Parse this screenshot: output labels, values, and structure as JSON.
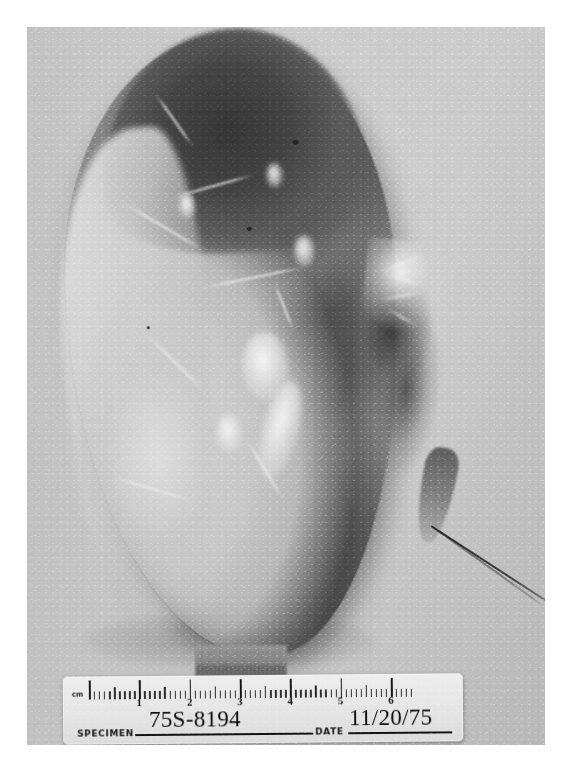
{
  "image": {
    "kind": "gross-pathology-photograph",
    "description": "Black-and-white photograph of a bisected kidney specimen photographed beside a centimeter ruler / specimen identification card.",
    "tone": "monochrome"
  },
  "photo": {
    "background_color": "#c9c9c7",
    "border_color": "#ffffff",
    "subject_label": "sectioned-kidney-specimen"
  },
  "specimen": {
    "name": "kidney",
    "features": [
      {
        "name": "superior-pole",
        "tone": "dark"
      },
      {
        "name": "renal-capsule",
        "tone": "pale"
      },
      {
        "name": "cortical-surface",
        "tone": "pale"
      },
      {
        "name": "medulla",
        "tone": "dark"
      },
      {
        "name": "hilum",
        "tone": "mixed"
      },
      {
        "name": "ureter",
        "tone": "dark"
      }
    ]
  },
  "support_block": {
    "name": "specimen-support-block",
    "tone": "grey"
  },
  "label_card": {
    "unit_mark": "cm",
    "specimen_label": "SPECIMEN",
    "specimen_value": "75S-8194",
    "date_label": "DATE",
    "date_value": "11/20/75",
    "card_color": "#f0eeea",
    "ink_color": "#141414"
  },
  "ruler": {
    "unit": "cm",
    "major_numbers": [
      "1",
      "2",
      "3",
      "4",
      "5",
      "6"
    ],
    "major_count": 6,
    "minor_per_major": 10,
    "start_cm": 0,
    "end_cm": 6.4
  }
}
